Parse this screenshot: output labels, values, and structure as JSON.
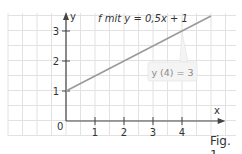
{
  "chart_data": {
    "type": "line",
    "title": "f mit y = 0,5x + 1",
    "function": "y = 0,5x + 1",
    "xlabel": "x",
    "ylabel": "y",
    "xticks": [
      "1",
      "2",
      "3",
      "4"
    ],
    "yticks": [
      "1",
      "2",
      "3"
    ],
    "origin_label": "0",
    "xlim": [
      -2,
      5.5
    ],
    "ylim": [
      -0.5,
      3.5
    ],
    "grid": true,
    "grid_step": 0.5,
    "series": [
      {
        "name": "f",
        "x": [
          0,
          5
        ],
        "values": [
          1,
          3.5
        ],
        "color": "#9a9a9a"
      }
    ],
    "annotations": [
      {
        "text": "y (4) = 3",
        "point": [
          4,
          3
        ]
      }
    ]
  },
  "figure": {
    "label": "Fig. 1"
  },
  "colors": {
    "grid": "#e2e2e2",
    "axis": "#444444",
    "line": "#9a9a9a",
    "callout_bg": "#f4f4f4",
    "callout_text": "#8a8a8a"
  }
}
